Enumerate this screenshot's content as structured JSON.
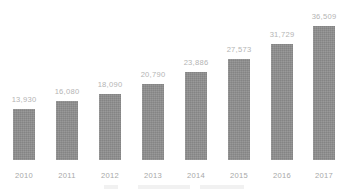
{
  "chart_data": {
    "type": "bar",
    "title": "",
    "subtitle": "",
    "xlabel": "",
    "ylabel": "",
    "categories": [
      "2010",
      "2011",
      "2012",
      "2013",
      "2014",
      "2015",
      "2016",
      "2017"
    ],
    "values": [
      13930,
      16080,
      18090,
      20790,
      23886,
      27573,
      31729,
      36509
    ],
    "value_labels": [
      "13,930",
      "16,080",
      "18,090",
      "20,790",
      "23,886",
      "27,573",
      "31,729",
      "36,509"
    ],
    "series": [
      {
        "name": "",
        "values": [
          13930,
          16080,
          18090,
          20790,
          23886,
          27573,
          31729,
          36509
        ]
      }
    ],
    "ylim": [
      0,
      40000
    ],
    "grid": false,
    "legend": false,
    "legend_position": "none",
    "orientation": "vertical",
    "data_labels": true,
    "axis_line": false,
    "colors": {
      "bar": "#8d8d8d",
      "value_label": "#b4b4b4",
      "category_label": "#a8a8a8",
      "background": "#ffffff"
    }
  },
  "bars": [
    {
      "category": "2010",
      "label": "13,930",
      "value": 13930
    },
    {
      "category": "2011",
      "label": "16,080",
      "value": 16080
    },
    {
      "category": "2012",
      "label": "18,090",
      "value": 18090
    },
    {
      "category": "2013",
      "label": "20,790",
      "value": 20790
    },
    {
      "category": "2014",
      "label": "23,886",
      "value": 23886
    },
    {
      "category": "2015",
      "label": "27,573",
      "value": 27573
    },
    {
      "category": "2016",
      "label": "31,729",
      "value": 31729
    },
    {
      "category": "2017",
      "label": "36,509",
      "value": 36509
    }
  ]
}
